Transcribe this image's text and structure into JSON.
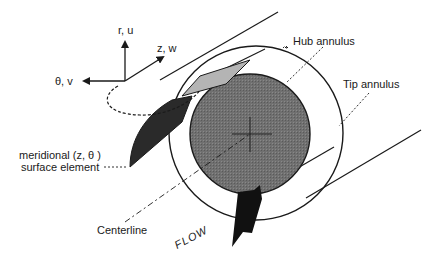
{
  "labels": {
    "axis_r": "r, u",
    "axis_z": "z, w",
    "axis_theta": "θ, v",
    "hub": "Hub annulus",
    "tip": "Tip annulus",
    "meridional_line1": "meridional (z, θ )",
    "meridional_line2": "surface element",
    "centerline": "Centerline",
    "flow": "FLOW"
  },
  "colors": {
    "line": "#1a1a1a",
    "hub_fill": "#6e6e6e",
    "element_dark": "#2a2a2a",
    "element_light": "#b4b4b4",
    "background": "#ffffff"
  }
}
